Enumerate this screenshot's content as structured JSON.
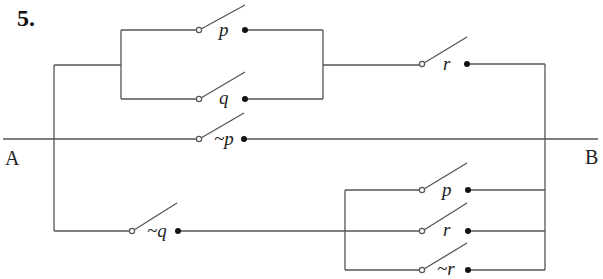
{
  "problem_number": "5.",
  "terminals": {
    "left": "A",
    "right": "B"
  },
  "switches": [
    {
      "id": "p-top",
      "label": "p",
      "x1": 199,
      "x2": 245,
      "y": 30
    },
    {
      "id": "q-top",
      "label": "q",
      "x1": 199,
      "x2": 245,
      "y": 99
    },
    {
      "id": "r-top",
      "label": "r",
      "x1": 422,
      "x2": 467,
      "y": 64
    },
    {
      "id": "not-p",
      "label": "~p",
      "x1": 199,
      "x2": 244,
      "y": 139
    },
    {
      "id": "not-q",
      "label": "~q",
      "x1": 132,
      "x2": 178,
      "y": 231
    },
    {
      "id": "p-bottom",
      "label": "p",
      "x1": 422,
      "x2": 468,
      "y": 190
    },
    {
      "id": "r-bottom",
      "label": "r",
      "x1": 422,
      "x2": 468,
      "y": 231
    },
    {
      "id": "not-r",
      "label": "~r",
      "x1": 422,
      "x2": 468,
      "y": 270
    }
  ],
  "colors": {
    "wire": "#555555",
    "dot": "#111111",
    "text": "#222222"
  }
}
